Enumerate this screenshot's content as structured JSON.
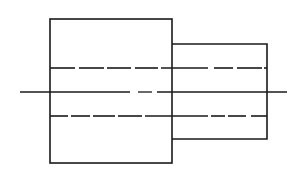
{
  "diagram": {
    "type": "orthographic-view",
    "background": "#ffffff",
    "stroke_color": "#1a1a1a",
    "large_section": {
      "x": 50,
      "y": 19,
      "width": 122,
      "height": 144
    },
    "small_section": {
      "x": 172,
      "y": 44,
      "width": 95,
      "height": 95
    },
    "hidden_lines": [
      {
        "y": 68,
        "dashes": [
          [
            50,
            75
          ],
          [
            79,
            104
          ],
          [
            107,
            131
          ],
          [
            135,
            158
          ],
          [
            161,
            208
          ],
          [
            214,
            233
          ],
          [
            237,
            262
          ],
          [
            264,
            267
          ]
        ]
      },
      {
        "y": 116,
        "dashes": [
          [
            50,
            68
          ],
          [
            71,
            90
          ],
          [
            93,
            115
          ],
          [
            118,
            142
          ],
          [
            145,
            208
          ],
          [
            211,
            225
          ],
          [
            228,
            246
          ],
          [
            251,
            267
          ]
        ]
      }
    ],
    "center_line": {
      "y": 92,
      "segments": [
        [
          20,
          130
        ],
        [
          138,
          152
        ],
        [
          157,
          287
        ]
      ]
    }
  }
}
